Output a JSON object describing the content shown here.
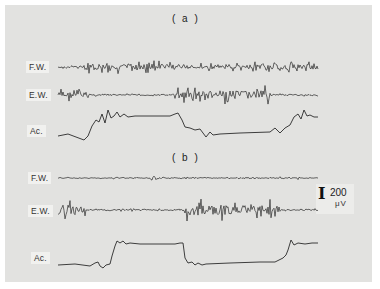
{
  "chart_data": {
    "type": "line",
    "title": "",
    "panels": [
      {
        "label": "( a )",
        "traces": [
          {
            "name": "F.W.",
            "kind": "emg",
            "baseline_y": 67,
            "x_start": 58,
            "x_end": 318,
            "bursts": [
              [
                85,
                180,
                5
              ],
              [
                180,
                250,
                3
              ],
              [
                250,
                318,
                4
              ]
            ],
            "noise": 1.2,
            "seed": 3
          },
          {
            "name": "E.W.",
            "kind": "emg",
            "baseline_y": 95,
            "x_start": 58,
            "x_end": 318,
            "bursts": [
              [
                58,
                90,
                5
              ],
              [
                175,
                270,
                7
              ]
            ],
            "noise": 1.0,
            "seed": 7
          },
          {
            "name": "Ac.",
            "kind": "accel",
            "points": [
              [
                58,
                136
              ],
              [
                68,
                134
              ],
              [
                76,
                137
              ],
              [
                84,
                140
              ],
              [
                88,
                136
              ],
              [
                92,
                126
              ],
              [
                96,
                120
              ],
              [
                99,
                122
              ],
              [
                102,
                114
              ],
              [
                105,
                123
              ],
              [
                108,
                110
              ],
              [
                111,
                118
              ],
              [
                114,
                116
              ],
              [
                117,
                112
              ],
              [
                120,
                117
              ],
              [
                124,
                114
              ],
              [
                128,
                117
              ],
              [
                135,
                116
              ],
              [
                150,
                116
              ],
              [
                170,
                116
              ],
              [
                175,
                114
              ],
              [
                178,
                113
              ],
              [
                182,
                120
              ],
              [
                185,
                127
              ],
              [
                190,
                128
              ],
              [
                195,
                130
              ],
              [
                200,
                129
              ],
              [
                203,
                133
              ],
              [
                206,
                137
              ],
              [
                210,
                132
              ],
              [
                213,
                135
              ],
              [
                220,
                134
              ],
              [
                240,
                133
              ],
              [
                270,
                132
              ],
              [
                275,
                128
              ],
              [
                280,
                133
              ],
              [
                285,
                128
              ],
              [
                290,
                125
              ],
              [
                294,
                117
              ],
              [
                298,
                114
              ],
              [
                301,
                119
              ],
              [
                304,
                110
              ],
              [
                307,
                116
              ],
              [
                310,
                115
              ],
              [
                314,
                117
              ],
              [
                318,
                117
              ]
            ]
          }
        ]
      },
      {
        "label": "( b )",
        "traces": [
          {
            "name": "F.W.",
            "kind": "emg",
            "baseline_y": 178,
            "x_start": 58,
            "x_end": 318,
            "bursts": [
              [
                150,
                170,
                1.5
              ],
              [
                280,
                300,
                1.5
              ]
            ],
            "noise": 0.7,
            "seed": 11
          },
          {
            "name": "E.W.",
            "kind": "emg",
            "baseline_y": 210,
            "x_start": 58,
            "x_end": 318,
            "bursts": [
              [
                58,
                85,
                8
              ],
              [
                185,
                280,
                8
              ]
            ],
            "noise": 1.0,
            "seed": 19
          },
          {
            "name": "Ac.",
            "kind": "accel",
            "points": [
              [
                58,
                265
              ],
              [
                75,
                264
              ],
              [
                90,
                266
              ],
              [
                95,
                263
              ],
              [
                98,
                262
              ],
              [
                100,
                266
              ],
              [
                103,
                268
              ],
              [
                106,
                265
              ],
              [
                110,
                264
              ],
              [
                112,
                256
              ],
              [
                115,
                246
              ],
              [
                117,
                241
              ],
              [
                120,
                243
              ],
              [
                123,
                241
              ],
              [
                126,
                244
              ],
              [
                130,
                243
              ],
              [
                140,
                244
              ],
              [
                160,
                244
              ],
              [
                175,
                244
              ],
              [
                180,
                243
              ],
              [
                183,
                243
              ],
              [
                185,
                258
              ],
              [
                188,
                263
              ],
              [
                192,
                262
              ],
              [
                195,
                265
              ],
              [
                198,
                263
              ],
              [
                202,
                265
              ],
              [
                206,
                264
              ],
              [
                230,
                263
              ],
              [
                260,
                262
              ],
              [
                275,
                262
              ],
              [
                283,
                258
              ],
              [
                286,
                255
              ],
              [
                288,
                250
              ],
              [
                291,
                240
              ],
              [
                294,
                245
              ],
              [
                298,
                243
              ],
              [
                305,
                244
              ],
              [
                312,
                243
              ],
              [
                318,
                243
              ]
            ]
          }
        ]
      }
    ],
    "scale_bar": {
      "value": "200",
      "unit": "μV"
    },
    "xlabel": "",
    "ylabel": ""
  },
  "labels": {
    "panel_a": "( a )",
    "panel_b": "( b )",
    "a_fw": "F.W.",
    "a_ew": "E.W.",
    "a_ac": "Ac.",
    "b_fw": "F.W.",
    "b_ew": "E.W.",
    "b_ac": "Ac.",
    "scale_value": "200",
    "scale_unit": "μV",
    "scale_glyph": "I"
  }
}
